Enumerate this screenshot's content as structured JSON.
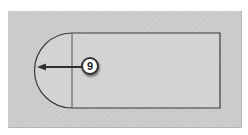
{
  "diagram": {
    "type": "technical-illustration",
    "callout": {
      "label": "9",
      "shape": "circle"
    },
    "colors": {
      "background": "#ffffff",
      "panel": "#cbcbcb",
      "shape_fill": "#d3d3d3",
      "outline": "#3a3a3a",
      "callout_fill": "#ffffff",
      "callout_border": "#333333"
    }
  }
}
